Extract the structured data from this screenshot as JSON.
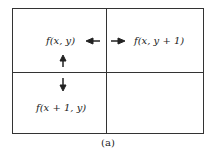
{
  "diagram": {
    "cells": {
      "top_left": "f(x, y)",
      "top_right": "f(x, y + 1)",
      "bottom_left": "f(x + 1, y)",
      "bottom_right": ""
    },
    "arrows": [
      {
        "from": "top_left",
        "to": "top_right",
        "direction": "horizontal-bidirectional"
      },
      {
        "from": "top_left",
        "to": "bottom_left",
        "direction": "vertical-bidirectional"
      }
    ],
    "caption": "(a)"
  }
}
